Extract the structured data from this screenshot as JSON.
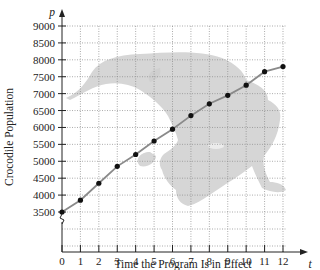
{
  "chart_data": {
    "type": "line",
    "title": "",
    "xlabel": "Time the Program Is in Effect",
    "ylabel": "Crocodile Population",
    "x_axis_symbol": "t",
    "y_axis_symbol": "p",
    "x": [
      0,
      1,
      2,
      3,
      4,
      5,
      6,
      7,
      8,
      9,
      10,
      11,
      12
    ],
    "values": [
      3500,
      3850,
      4350,
      4850,
      5200,
      5600,
      5950,
      6350,
      6700,
      6950,
      7250,
      7650,
      7800
    ],
    "xticks": [
      "0",
      "1",
      "2",
      "3",
      "4",
      "5",
      "6",
      "7",
      "8",
      "9",
      "10",
      "11",
      "12"
    ],
    "yticks": [
      "3500",
      "4000",
      "4500",
      "5000",
      "5500",
      "6000",
      "6500",
      "7000",
      "7500",
      "8000",
      "8500",
      "9000"
    ],
    "xlim": [
      0,
      12
    ],
    "ylim": [
      3500,
      9000
    ],
    "grid": true,
    "axis_break": true,
    "background_image": "crocodile silhouette",
    "line_color": "#8a8a8a",
    "marker_color": "#111111",
    "silhouette_color": "#d4d4d4"
  }
}
